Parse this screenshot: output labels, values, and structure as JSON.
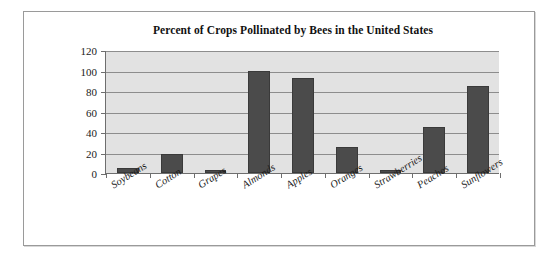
{
  "chart_data": {
    "type": "bar",
    "title": "Percent of Crops Pollinated by Bees in the United States",
    "xlabel": "",
    "ylabel": "",
    "categories": [
      "Soybeans",
      "Cotton",
      "Grapes",
      "Almonds",
      "Apples",
      "Oranges",
      "Strawberries",
      "Peaches",
      "Sunflowers"
    ],
    "values": [
      5,
      19,
      3,
      100,
      93,
      25,
      3,
      45,
      85
    ],
    "ylim": [
      0,
      120
    ],
    "yticks": [
      0,
      20,
      40,
      60,
      80,
      100,
      120
    ],
    "ytick_labels": [
      "0",
      "20",
      "40",
      "60",
      "80",
      "100",
      "120"
    ],
    "grid": true,
    "legend": "none",
    "series_color": "#4b4b4b",
    "plot_background": "#e2e2e2",
    "figure_background": "#ffffff"
  }
}
